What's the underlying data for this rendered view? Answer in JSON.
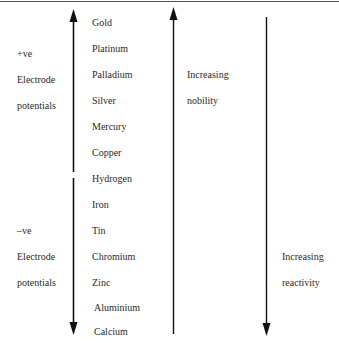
{
  "series_label": "Electrochemical series",
  "metals": [
    "Gold",
    "Platinum",
    "Palladium",
    "Silver",
    "Mercury",
    "Copper",
    "Hydrogen",
    "Iron",
    "Tin",
    "Chromium",
    "Zinc",
    "Aluminium",
    "Calcium"
  ],
  "left_labels": {
    "positive": {
      "sign": "+ve",
      "line1": "Electrode",
      "line2": "potentials"
    },
    "negative": {
      "sign": "–ve",
      "line1": "Electrode",
      "line2": "potentials"
    }
  },
  "middle_label": {
    "line1": "Increasing",
    "line2": "nobility"
  },
  "right_label": {
    "line1": "Increasing",
    "line2": "reactivity"
  },
  "colors": {
    "ink": "#2a2a2a",
    "arrow": "#111111",
    "rule": "#555555"
  }
}
